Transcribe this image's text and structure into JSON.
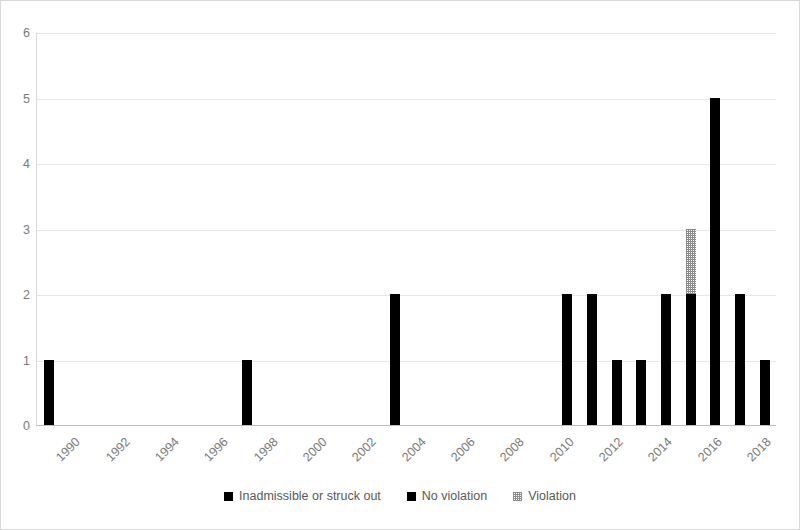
{
  "chart_data": {
    "type": "bar",
    "title": "",
    "subtitle": "",
    "xlabel": "",
    "ylabel": "",
    "ylim": [
      0,
      6
    ],
    "yticks": [
      0,
      1,
      2,
      3,
      4,
      5,
      6
    ],
    "grid": true,
    "stacked": true,
    "legend_position": "bottom",
    "x_tick_labels": [
      "1990",
      "1992",
      "1994",
      "1996",
      "1998",
      "2000",
      "2002",
      "2004",
      "2006",
      "2008",
      "2010",
      "2012",
      "2014",
      "2016",
      "2018"
    ],
    "x_tick_years": [
      1990,
      1992,
      1994,
      1996,
      1998,
      2000,
      2002,
      2004,
      2006,
      2008,
      2010,
      2012,
      2014,
      2016,
      2018
    ],
    "x_range": [
      1989.5,
      2019.5
    ],
    "categories": [
      1990,
      1991,
      1992,
      1993,
      1994,
      1995,
      1996,
      1997,
      1998,
      1999,
      2000,
      2001,
      2002,
      2003,
      2004,
      2005,
      2006,
      2007,
      2008,
      2009,
      2010,
      2011,
      2012,
      2013,
      2014,
      2015,
      2016,
      2017,
      2018,
      2019
    ],
    "series": [
      {
        "name": "Inadmissible or struck out",
        "color": "#000000",
        "pattern": "solid",
        "values": [
          1,
          0,
          0,
          0,
          0,
          0,
          0,
          0,
          1,
          0,
          0,
          0,
          0,
          0,
          2,
          0,
          0,
          0,
          0,
          0,
          0,
          2,
          2,
          1,
          1,
          2,
          2,
          5,
          2,
          1
        ]
      },
      {
        "name": "No violation",
        "color": "#000000",
        "pattern": "solid",
        "values": [
          0,
          0,
          0,
          0,
          0,
          0,
          0,
          0,
          0,
          0,
          0,
          0,
          0,
          0,
          0,
          0,
          0,
          0,
          0,
          0,
          0,
          0,
          0,
          0,
          0,
          0,
          0,
          0,
          0,
          0
        ]
      },
      {
        "name": "Violation",
        "color": "#8a8a8a",
        "pattern": "hatch",
        "values": [
          0,
          0,
          0,
          0,
          0,
          0,
          0,
          0,
          0,
          0,
          0,
          0,
          0,
          0,
          0,
          0,
          0,
          0,
          0,
          0,
          0,
          0,
          0,
          0,
          0,
          0,
          1,
          0,
          0,
          0
        ]
      }
    ]
  },
  "legend": {
    "items": [
      {
        "label": "Inadmissible or struck out",
        "color": "#000000",
        "pattern": "solid"
      },
      {
        "label": "No violation",
        "color": "#000000",
        "pattern": "solid"
      },
      {
        "label": "Violation",
        "color": "#8a8a8a",
        "pattern": "hatch"
      }
    ]
  },
  "colors": {
    "bar_primary": "#000000",
    "bar_violation": "#8a8a8a",
    "gridline": "#e6e6e6",
    "axis": "#bfbfbf",
    "tick_text": "#7a7a7a",
    "legend_text": "#595959",
    "frame": "#d9d9d9",
    "background": "#ffffff"
  }
}
